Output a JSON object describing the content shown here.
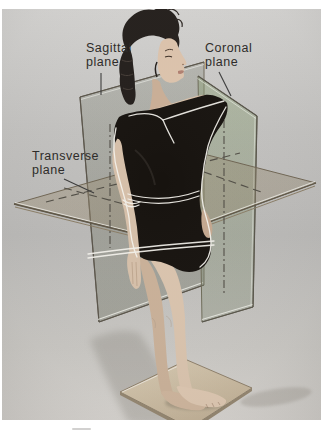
{
  "figure": {
    "type": "anatomy-body-planes-photo-diagram",
    "labels": {
      "sagittal": {
        "line1": "Sagittal",
        "line2": "plane"
      },
      "coronal": {
        "line1": "Coronal",
        "line2": "plane"
      },
      "transverse": {
        "line1": "Transverse",
        "line2": "plane"
      }
    },
    "colors": {
      "page_background": "#ffffff",
      "photo_background": "#c3c2c0",
      "plane_glass_gray": "#8d9180",
      "coronal_green_tint": "#93a083",
      "transverse_tan": "#a89e84",
      "plane_edge": "#5d5546",
      "white_intersection_line": "#f4f2ec",
      "skin": "#d8c2ac",
      "hair": "#231e1b",
      "leotard": "#17130f",
      "platform": "#cbbda4",
      "label_text": "#2e2c2a",
      "leader_line": "#3b3b3b"
    }
  }
}
